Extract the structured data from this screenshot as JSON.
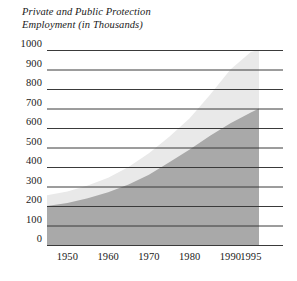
{
  "chart_data": {
    "type": "area",
    "title": "Private and Public Protection\nEmployment (in Thousands)",
    "title_line1": "Private and Public Protection",
    "title_line2": "Employment (in Thousands)",
    "xlabel": "",
    "ylabel": "",
    "ylim": [
      0,
      1000
    ],
    "xlim": [
      1945,
      1997
    ],
    "grid": true,
    "grid_orientation": "horizontal",
    "legend": "none",
    "stacked": true,
    "ytick_labels": [
      "1000",
      "900",
      "800",
      "700",
      "600",
      "500",
      "400",
      "300",
      "200",
      "100",
      "0"
    ],
    "ytick_values": [
      1000,
      900,
      800,
      700,
      600,
      500,
      400,
      300,
      200,
      100,
      0
    ],
    "xtick_labels": [
      "1950",
      "1960",
      "1970",
      "1980",
      "1990",
      "1995"
    ],
    "xtick_values": [
      1950,
      1960,
      1970,
      1980,
      1990,
      1995
    ],
    "x": [
      1945,
      1950,
      1955,
      1960,
      1965,
      1970,
      1975,
      1980,
      1985,
      1990,
      1995,
      1997
    ],
    "series": [
      {
        "name": "Public Protection Employment",
        "color": "#a9a9a9",
        "values": [
          200,
          215,
          240,
          270,
          310,
          360,
          425,
          490,
          560,
          625,
          680,
          700
        ]
      },
      {
        "name": "Private Protection Employment",
        "color": "#e9e9e9",
        "values": [
          55,
          60,
          65,
          75,
          90,
          110,
          130,
          160,
          210,
          275,
          310,
          300
        ]
      }
    ],
    "totals": [
      255,
      275,
      305,
      345,
      400,
      470,
      555,
      650,
      770,
      900,
      990,
      1000
    ]
  },
  "colors": {
    "dark_area": "#a9a9a9",
    "light_area": "#e9e9e9",
    "gridline": "#3a3a3a",
    "text": "#1a1a1a",
    "background": "#ffffff"
  }
}
